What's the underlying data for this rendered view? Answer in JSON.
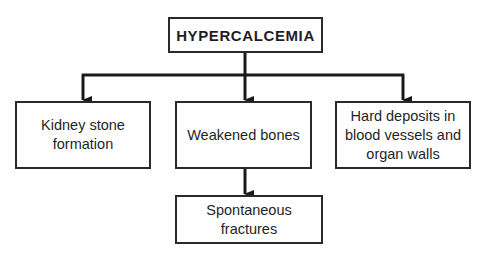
{
  "diagram": {
    "type": "flowchart",
    "root": {
      "id": "hypercalcemia",
      "label": "HYPERCALCEMIA"
    },
    "children": [
      {
        "id": "kidney-stone",
        "label": "Kidney stone\nformation"
      },
      {
        "id": "weakened-bones",
        "label": "Weakened bones"
      },
      {
        "id": "hard-deposits",
        "label": "Hard deposits in\nblood vessels and\norgan walls"
      }
    ],
    "grandchildren": [
      {
        "id": "spontaneous-fractures",
        "parent": "weakened-bones",
        "label": "Spontaneous\nfractures"
      }
    ],
    "edges": [
      {
        "from": "hypercalcemia",
        "to": "kidney-stone"
      },
      {
        "from": "hypercalcemia",
        "to": "weakened-bones"
      },
      {
        "from": "hypercalcemia",
        "to": "hard-deposits"
      },
      {
        "from": "weakened-bones",
        "to": "spontaneous-fractures"
      }
    ],
    "colors": {
      "line": "#1a1a1a",
      "border": "#2a2a2a",
      "background": "#ffffff",
      "text": "#1f1f1f"
    }
  }
}
